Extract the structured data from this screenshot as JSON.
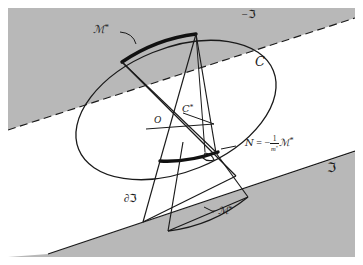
{
  "figure": {
    "canvas": {
      "width": 363,
      "height": 265
    },
    "colors": {
      "shaded_region": "#b8b8b8",
      "stroke": "#1a1a1a",
      "background": "#ffffff",
      "thick_arc": "#111111"
    },
    "labels": {
      "m_star": "ℳ",
      "m_star_sup": "*",
      "neg_m_star_prefix": "−",
      "curve_c": "C",
      "c_star": "C",
      "c_star_sup": "*",
      "origin": "O",
      "neg_J": "−",
      "frak_J": "ℑ",
      "boundary_J_prefix": "∂",
      "n_symbol": "ᵊʹ",
      "script_N": "N",
      "equals": "=",
      "minus": "−",
      "fraction_numerator": "1",
      "fraction_denominator": "m",
      "fraction_denominator_sup": "*"
    },
    "annotations": [
      {
        "name": "m-star-label",
        "text": "ℳ*",
        "x": 98,
        "y": 30,
        "desc": "label for thick upper arc"
      },
      {
        "name": "neg-frak-j-label",
        "text": "−ℑ",
        "x": 245,
        "y": 13,
        "desc": "upper shaded halfspace"
      },
      {
        "name": "curve-c-label",
        "text": "C",
        "x": 258,
        "y": 62,
        "desc": "ellipse / convex body"
      },
      {
        "name": "c-star-label",
        "text": "C*",
        "x": 185,
        "y": 110,
        "desc": "dual body"
      },
      {
        "name": "origin-label",
        "text": "O",
        "x": 157,
        "y": 122,
        "desc": "origin point"
      },
      {
        "name": "n-equation-label",
        "text": "N = -1/m* M*",
        "x": 239,
        "y": 143,
        "desc": "normal vector equation"
      },
      {
        "name": "frak-j-label",
        "text": "ℑ",
        "x": 330,
        "y": 168,
        "desc": "lower shaded halfspace"
      },
      {
        "name": "boundary-j-label",
        "text": "∂ℑ",
        "x": 128,
        "y": 199,
        "desc": "boundary of J"
      },
      {
        "name": "neg-m-star-label",
        "text": "−ℳ*",
        "x": 215,
        "y": 211,
        "desc": "label for lower arc"
      }
    ],
    "geometry": {
      "upper_band_polygon": "0,12 363,12 363,0 0,0",
      "upper_band_desc": "gray region above dashed line",
      "upper_dashed_line": {
        "x1": 14,
        "y1": 128,
        "x2": 349,
        "y2": 17
      },
      "lower_solid_line": {
        "x1": 52,
        "y1": 251,
        "x2": 349,
        "y2": 152
      },
      "ellipse": {
        "cx": 176,
        "cy": 110,
        "rx": 104,
        "ry": 62,
        "rotation": -22
      },
      "frame": {
        "x": 8,
        "y": 8,
        "width": 347,
        "height": 249
      }
    }
  }
}
